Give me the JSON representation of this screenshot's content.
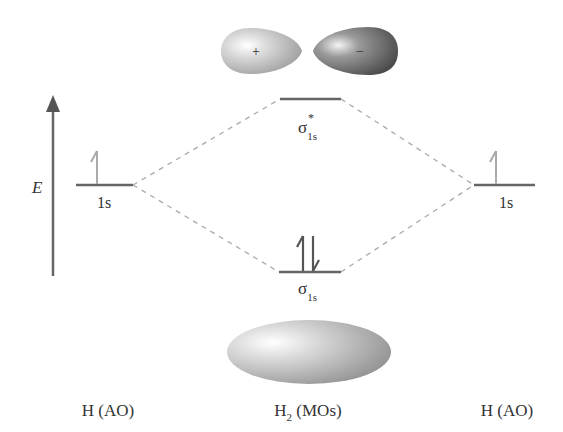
{
  "diagram": {
    "type": "molecular-orbital-energy-diagram",
    "axis": {
      "label": "E"
    },
    "left_atom": {
      "level_label": "1s",
      "electrons": "↿",
      "bottom_label": "H (AO)"
    },
    "right_atom": {
      "level_label": "1s",
      "electrons": "↿",
      "bottom_label": "H (AO)"
    },
    "antibonding": {
      "symbol": "σ",
      "superscript": "*",
      "subscript": "1s",
      "lobe_left_sign": "+",
      "lobe_right_sign": "−"
    },
    "bonding": {
      "symbol": "σ",
      "subscript": "1s",
      "electrons": "⇅"
    },
    "molecule_label": {
      "main": "H",
      "subscript": "2",
      "suffix": " (MOs)"
    },
    "colors": {
      "level_line": "#555555",
      "dash": "#aaaaaa",
      "atom_arrow": "#aaaaaa",
      "bond_arrow": "#555555",
      "axis": "#555555"
    }
  }
}
